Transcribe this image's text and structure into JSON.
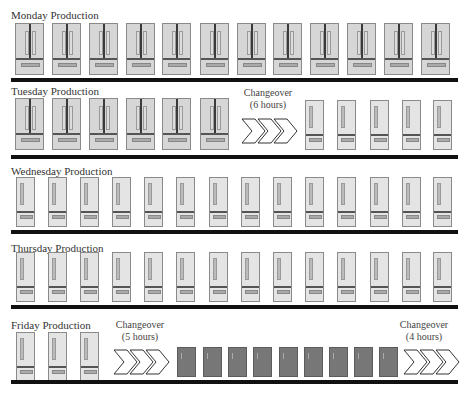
{
  "rows": [
    {
      "title": "Monday Production",
      "items": [
        {
          "type": "french",
          "count": 12
        }
      ]
    },
    {
      "title": "Tuesday Production",
      "items": [
        {
          "type": "french",
          "count": 6
        },
        {
          "type": "changeover",
          "label": "Changeover",
          "duration": "(6 hours)"
        },
        {
          "type": "single",
          "count": 5
        }
      ]
    },
    {
      "title": "Wednesday Production",
      "items": [
        {
          "type": "single",
          "count": 14
        }
      ]
    },
    {
      "title": "Thursday Production",
      "items": [
        {
          "type": "single",
          "count": 14
        }
      ]
    },
    {
      "title": "Friday Production",
      "items": [
        {
          "type": "single",
          "count": 3
        },
        {
          "type": "changeover",
          "label": "Changeover",
          "duration": "(5 hours)"
        },
        {
          "type": "dark",
          "count": 9
        },
        {
          "type": "changeover",
          "label": "Changeover",
          "duration": "(4 hours)"
        }
      ]
    }
  ],
  "labels": {
    "monday": "Monday Production",
    "tuesday": "Tuesday Production",
    "wednesday": "Wednesday Production",
    "thursday": "Thursday Production",
    "friday": "Friday Production",
    "chg_tue": "Changeover",
    "chg_tue_dur": "(6 hours)",
    "chg_fri1": "Changeover",
    "chg_fri1_dur": "(5 hours)",
    "chg_fri2": "Changeover",
    "chg_fri2_dur": "(4 hours)"
  },
  "colors": {
    "french_door_fill": "#d6d6d6",
    "single_door_fill": "#e4e4e4",
    "dark_fridge_fill": "#777777",
    "divider": "#111111"
  }
}
